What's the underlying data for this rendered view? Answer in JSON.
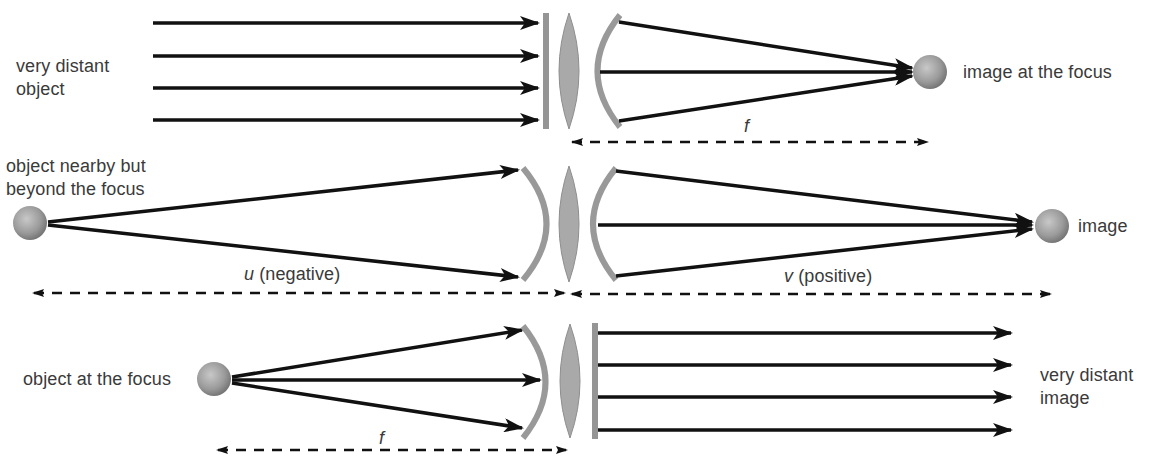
{
  "panels": [
    {
      "id": "top",
      "object_label": [
        "very distant",
        "object"
      ],
      "image_label": "image at the focus",
      "distance_label": "f",
      "description": "Parallel rays from a very distant object converge to an image at the focus"
    },
    {
      "id": "middle",
      "object_label": [
        "object nearby but",
        "beyond the focus"
      ],
      "image_label": "image",
      "distance_labels": {
        "u_symbol": "u",
        "u_text": " (negative)",
        "v_symbol": "v",
        "v_text": " (positive)"
      },
      "description": "Object beyond focus forms a real image on the other side"
    },
    {
      "id": "bottom",
      "object_label": "object at the focus",
      "image_label": [
        "very distant",
        "image"
      ],
      "distance_label": "f",
      "description": "Object at the focus produces parallel rays — a very distant image"
    }
  ],
  "colors": {
    "ray": "#111111",
    "element": "#9a9a9a",
    "lens_fill": "#a8a8a8",
    "sphere_light": "#c4c4c4",
    "sphere_dark": "#6e6e6e",
    "text": "#3a3a3a"
  }
}
